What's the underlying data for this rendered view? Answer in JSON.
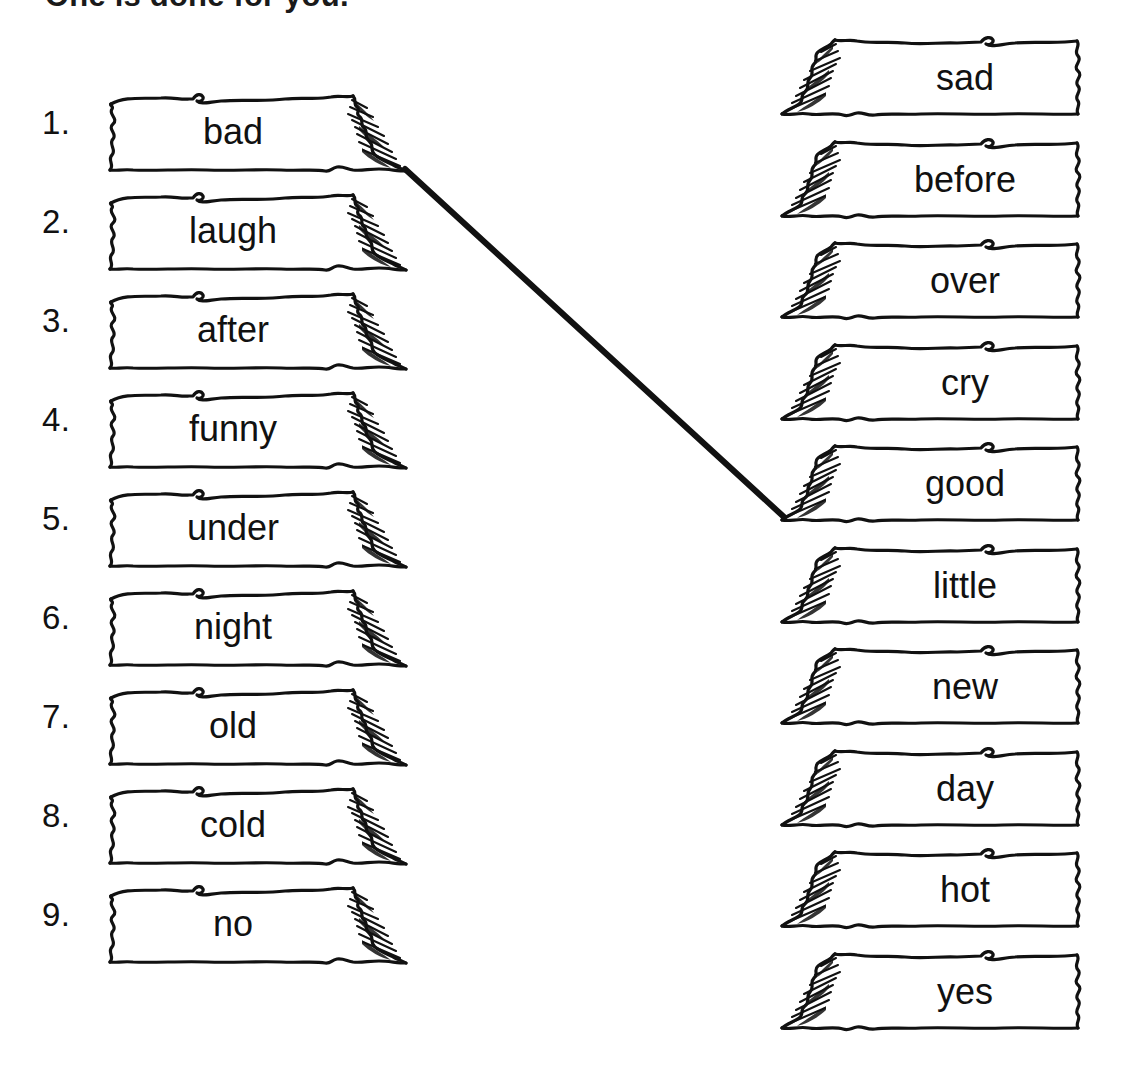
{
  "title": "One is done for you.",
  "colors": {
    "ink": "#111111",
    "paper": "#ffffff",
    "line": "#111111"
  },
  "left_column": {
    "name": "word-list-left",
    "items": [
      {
        "number": "1.",
        "word": "bad"
      },
      {
        "number": "2.",
        "word": "laugh"
      },
      {
        "number": "3.",
        "word": "after"
      },
      {
        "number": "4.",
        "word": "funny"
      },
      {
        "number": "5.",
        "word": "under"
      },
      {
        "number": "6.",
        "word": "night"
      },
      {
        "number": "7.",
        "word": "old"
      },
      {
        "number": "8.",
        "word": "cold"
      },
      {
        "number": "9.",
        "word": "no"
      }
    ]
  },
  "right_column": {
    "name": "word-list-right",
    "items": [
      {
        "word": "sad"
      },
      {
        "word": "before"
      },
      {
        "word": "over"
      },
      {
        "word": "cry"
      },
      {
        "word": "good"
      },
      {
        "word": "little"
      },
      {
        "word": "new"
      },
      {
        "word": "day"
      },
      {
        "word": "hot"
      },
      {
        "word": "yes"
      }
    ]
  },
  "connections": [
    {
      "from": "bad",
      "to": "good",
      "x1": 405,
      "y1": 169,
      "x2": 784,
      "y2": 517
    }
  ]
}
